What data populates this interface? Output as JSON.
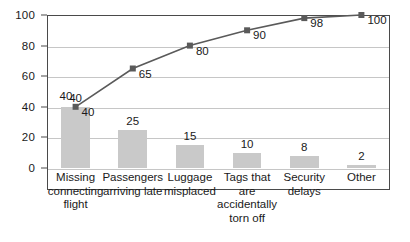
{
  "chart_data": {
    "type": "bar",
    "title": "",
    "subtitle": "",
    "xlabel": "",
    "ylabel": "",
    "ylim": [
      0,
      100
    ],
    "grid": true,
    "legend": "none",
    "categories": [
      "Missing connecting flight",
      "Passengers arriving late",
      "Luggage misplaced",
      "Tags that are accidentally torn off",
      "Security delays",
      "Other"
    ],
    "category_lines": [
      [
        "Missing",
        "connecting",
        "flight"
      ],
      [
        "Passengers",
        "arriving late"
      ],
      [
        "Luggage",
        "misplaced"
      ],
      [
        "Tags that",
        "are",
        "accidentally",
        "torn off"
      ],
      [
        "Security",
        "delays"
      ],
      [
        "Other"
      ]
    ],
    "series": [
      {
        "name": "Frequency",
        "type": "bar",
        "values": [
          40,
          25,
          15,
          10,
          8,
          2
        ],
        "labels": [
          "40",
          "25",
          "15",
          "10",
          "8",
          "2"
        ],
        "color": "#c9c9c9"
      },
      {
        "name": "Cumulative percent",
        "type": "line",
        "values": [
          40,
          65,
          80,
          90,
          98,
          100
        ],
        "labels": [
          "40",
          "65",
          "80",
          "90",
          "98",
          "100"
        ],
        "color": "#5a5a5a"
      }
    ],
    "yticks": [
      0,
      20,
      40,
      60,
      80,
      100
    ],
    "ytick_labels": [
      "0",
      "20",
      "40",
      "60",
      "80",
      "100"
    ]
  },
  "colors": {
    "bar_fill": "#c9c9c9",
    "line_stroke": "#5a5a5a",
    "marker_fill": "#5a5a5a",
    "gridline": "#c6c6c6",
    "axis": "#4a4a4a",
    "text": "#1a1a1a",
    "background": "#ffffff"
  }
}
